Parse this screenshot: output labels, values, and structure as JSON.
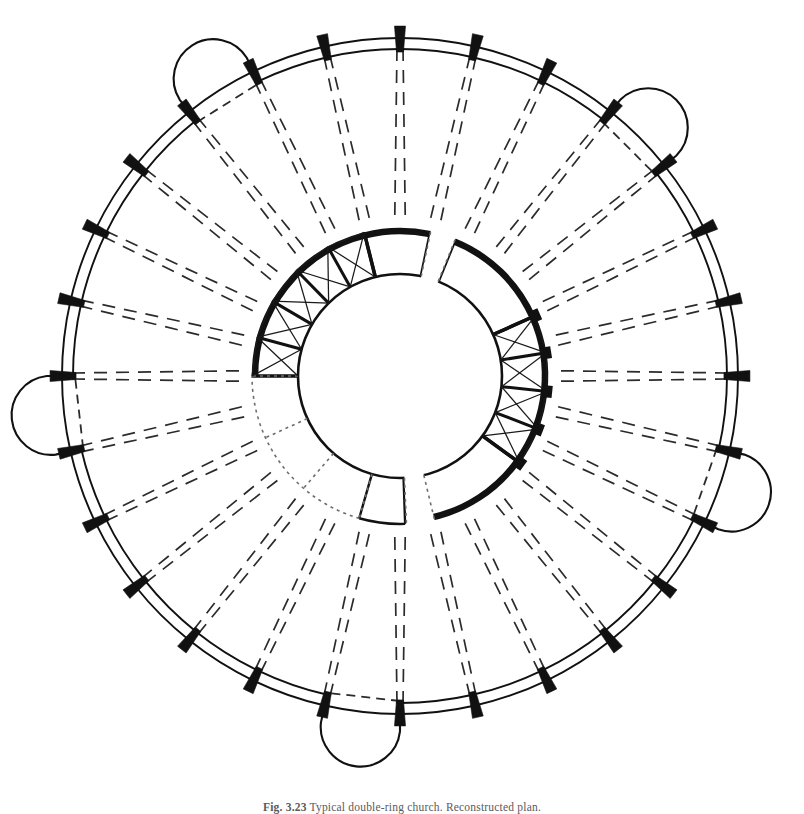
{
  "figure": {
    "kind": "architectural-plan",
    "caption_number": "Fig. 3.23",
    "caption_text": "Typical double-ring church. Reconstructed plan.",
    "caption_separator": "   "
  },
  "canvas": {
    "width": 804,
    "height": 814,
    "background": "#ffffff"
  },
  "colors": {
    "ink": "#111111",
    "pier_fill": "#111111",
    "thin_line": "#1a1a1a",
    "dashed_line": "#2b2b2b",
    "dotted_line": "#6e6e6e",
    "paper": "#ffffff"
  },
  "geometry": {
    "center_x": 400,
    "center_y": 376,
    "outer_ring_outer_radius": 338,
    "outer_ring_inner_radius": 327,
    "annulus_outer_radius": 148,
    "annulus_inner_radius": 102,
    "pier_count": 28,
    "pier_length": 26,
    "pier_width_outer": 11,
    "pier_width_inner": 7,
    "rib_inner_radius": 156,
    "start_angle_deg": -90
  },
  "chapels": [
    {
      "name": "chapel-north-west",
      "bay_index": 25,
      "label": "NW apse chapel",
      "depth": 54
    },
    {
      "name": "chapel-north-east",
      "bay_index": 3,
      "label": "NE apse chapel",
      "depth": 54
    },
    {
      "name": "chapel-west",
      "bay_index": 20,
      "label": "W apse chapel",
      "depth": 54
    },
    {
      "name": "chapel-east",
      "bay_index": 8,
      "label": "E apse chapel",
      "depth": 54
    },
    {
      "name": "chapel-south",
      "bay_index": 14,
      "label": "S apse chapel",
      "depth": 56
    }
  ],
  "annulus_sectors": [
    {
      "name": "sector-ne-vaulted",
      "from_deg": -90,
      "to_deg": -14,
      "style": "heavy",
      "vaults": true,
      "cells": 5
    },
    {
      "name": "sector-e-plain",
      "from_deg": -14,
      "to_deg": 12,
      "style": "heavy",
      "vaults": false,
      "cells": 1
    },
    {
      "name": "sector-se-plain",
      "from_deg": 22,
      "to_deg": 66,
      "style": "heavy",
      "vaults": false,
      "cells": 1
    },
    {
      "name": "sector-s-vaulted",
      "from_deg": 66,
      "to_deg": 126,
      "style": "heavy",
      "vaults": true,
      "cells": 4
    },
    {
      "name": "sector-sw-plain",
      "from_deg": 126,
      "to_deg": 168,
      "style": "heavy",
      "vaults": false,
      "cells": 1
    },
    {
      "name": "sector-w-plain",
      "from_deg": 178,
      "to_deg": 196,
      "style": "medium",
      "vaults": false,
      "cells": 1
    },
    {
      "name": "sector-nw-hidden",
      "from_deg": 196,
      "to_deg": 270,
      "style": "dotted",
      "vaults": false,
      "cells": 3
    }
  ],
  "openings": [
    {
      "name": "opening-west",
      "angle_deg": 172,
      "width_deg": 11
    },
    {
      "name": "opening-east",
      "angle_deg": 17,
      "width_deg": 10
    }
  ],
  "legend_notes": {
    "solid_heavy": "existing masonry wall",
    "dashed": "buttress / rib line above",
    "dotted": "reconstructed or hidden construction",
    "black_block": "pier"
  }
}
